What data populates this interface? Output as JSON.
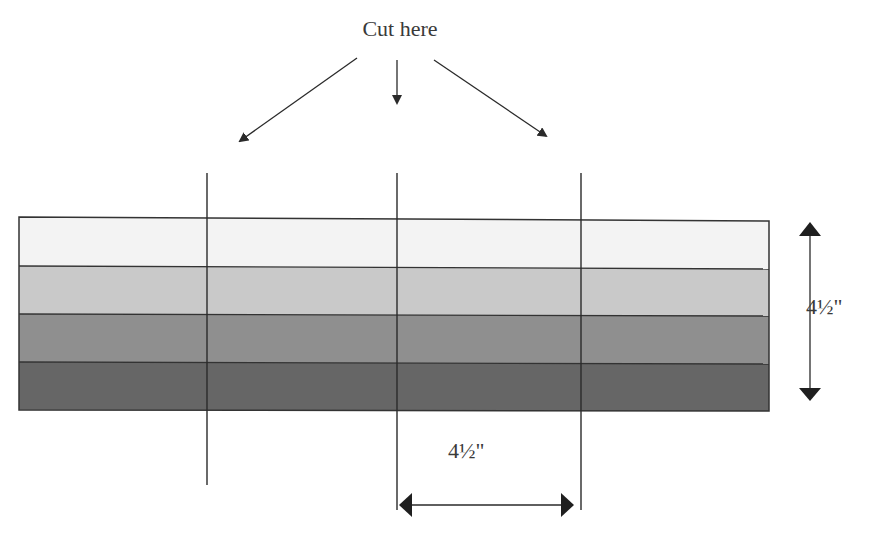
{
  "labels": {
    "cut_here": "Cut here",
    "height_dimension": "4½\"",
    "width_dimension": "4½\""
  },
  "strip": {
    "bands": [
      {
        "name": "band-1-lightest",
        "color": "#f3f3f3"
      },
      {
        "name": "band-2-light",
        "color": "#c9c9c9"
      },
      {
        "name": "band-3-medium",
        "color": "#8f8f8f"
      },
      {
        "name": "band-4-dark",
        "color": "#666666"
      }
    ],
    "outline_color": "#333333"
  },
  "cut_lines": [
    {
      "x": 207
    },
    {
      "x": 397
    },
    {
      "x": 581
    }
  ],
  "arrow_color": "#2a2a2a"
}
